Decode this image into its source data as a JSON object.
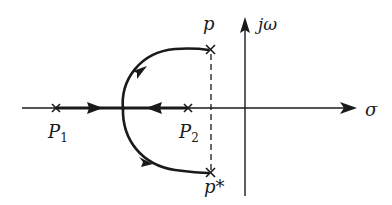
{
  "diagram": {
    "type": "root-locus",
    "axes": {
      "real_axis_label": "σ",
      "imag_axis_label": "jω"
    },
    "poles": [
      {
        "id": "P1",
        "label": "P",
        "subscript": "1",
        "position": "real axis, left"
      },
      {
        "id": "P2",
        "label": "P",
        "subscript": "2",
        "position": "real axis, near origin"
      },
      {
        "id": "p",
        "label": "p",
        "position": "upper complex pole"
      },
      {
        "id": "p_conj",
        "label": "p*",
        "position": "lower complex pole (conjugate)"
      }
    ],
    "branches": [
      "P1 to breakaway point (arrow pointing right)",
      "P2 to breakaway point (arrow pointing left)",
      "breakaway point arcs upward to p",
      "breakaway point arcs downward to p*"
    ],
    "dashed_line": "vertical between p and p*",
    "colors": {
      "stroke": "#1a1a1a",
      "background": "#ffffff"
    }
  },
  "labels": {
    "p1_main": "P",
    "p1_sub": "1",
    "p2_main": "P",
    "p2_sub": "2",
    "p_upper": "p",
    "p_lower": "p*",
    "sigma": "σ",
    "jomega": "jω"
  }
}
